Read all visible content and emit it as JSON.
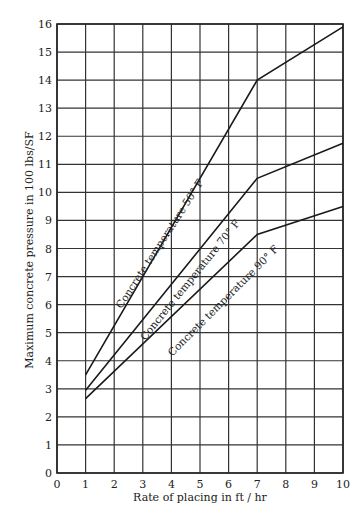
{
  "chart_data": {
    "type": "line",
    "title": "",
    "xlabel": "Rate of placing in ft / hr",
    "ylabel": "Maximum concrete pressure in 100 lbs/SF",
    "xlim": [
      0,
      10
    ],
    "ylim": [
      0,
      16
    ],
    "x_ticks": [
      "0",
      "1",
      "2",
      "3",
      "4",
      "5",
      "6",
      "7",
      "8",
      "9",
      "10"
    ],
    "y_ticks": [
      "0",
      "1",
      "2",
      "3",
      "4",
      "5",
      "6",
      "7",
      "8",
      "9",
      "10",
      "11",
      "12",
      "13",
      "14",
      "15",
      "16"
    ],
    "grid": true,
    "legend": "inline labels along lines",
    "series": [
      {
        "name": "Concrete temperature 50° F",
        "x": [
          1,
          7,
          10
        ],
        "values": [
          3.5,
          14.0,
          15.9
        ],
        "label_pos": {
          "x": 3.7,
          "y": 8.1,
          "angle": -57
        }
      },
      {
        "name": "Concrete temperature 70° F",
        "x": [
          1,
          7,
          10
        ],
        "values": [
          2.95,
          10.5,
          11.75
        ],
        "label_pos": {
          "x": 4.75,
          "y": 6.8,
          "angle": -51
        }
      },
      {
        "name": "Concrete temperature 90° F",
        "x": [
          1,
          7,
          10
        ],
        "values": [
          2.65,
          8.5,
          9.5
        ],
        "label_pos": {
          "x": 5.9,
          "y": 6.05,
          "angle": -45
        }
      }
    ]
  }
}
